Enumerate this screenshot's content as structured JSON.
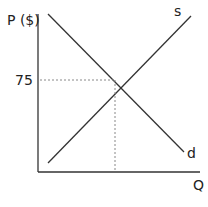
{
  "diagram": {
    "y_axis_label": "P ($)",
    "x_axis_label": "Q",
    "price_tick": "75",
    "supply_label": "s",
    "demand_label": "d",
    "line_color": "#333333",
    "guide_color": "#888888"
  }
}
